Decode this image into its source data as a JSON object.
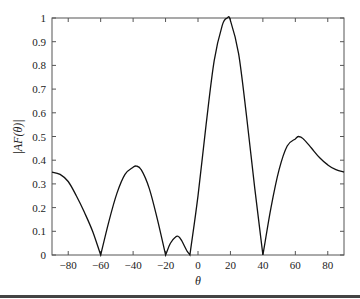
{
  "chart_data": {
    "type": "line",
    "title": "",
    "xlabel": "θ",
    "ylabel": "|AF(θ)|",
    "xlim": [
      -90,
      90
    ],
    "ylim": [
      0,
      1
    ],
    "grid": false,
    "legend": null,
    "xticks": [
      -80,
      -60,
      -40,
      -20,
      0,
      20,
      40,
      60,
      80
    ],
    "xtick_labels": [
      "−80",
      "−60",
      "−40",
      "−20",
      "0",
      "20",
      "40",
      "60",
      "80"
    ],
    "yticks": [
      0,
      0.1,
      0.2,
      0.3,
      0.4,
      0.5,
      0.6,
      0.7,
      0.8,
      0.9,
      1
    ],
    "ytick_labels": [
      "0",
      "0.1",
      "0.2",
      "0.3",
      "0.4",
      "0.5",
      "0.6",
      "0.7",
      "0.8",
      "0.9",
      "1"
    ],
    "series": [
      {
        "name": "|AF(θ)|",
        "color": "#111111",
        "x": [
          -90,
          -85,
          -80,
          -75,
          -70,
          -65,
          -60,
          -55,
          -50,
          -45,
          -40,
          -38,
          -35,
          -30,
          -25,
          -20,
          -17,
          -14,
          -12,
          -10,
          -7,
          -5,
          0,
          5,
          10,
          15,
          18,
          20,
          25,
          30,
          35,
          40,
          45,
          50,
          55,
          60,
          62,
          65,
          70,
          75,
          80,
          85,
          90
        ],
        "values": [
          0.35,
          0.34,
          0.31,
          0.25,
          0.18,
          0.1,
          0.0,
          0.14,
          0.26,
          0.34,
          0.37,
          0.375,
          0.36,
          0.28,
          0.15,
          0.0,
          0.05,
          0.075,
          0.078,
          0.06,
          0.02,
          0.0,
          0.25,
          0.55,
          0.82,
          0.97,
          1.0,
          0.99,
          0.85,
          0.58,
          0.28,
          0.0,
          0.2,
          0.36,
          0.46,
          0.49,
          0.5,
          0.49,
          0.45,
          0.41,
          0.38,
          0.36,
          0.35
        ]
      }
    ]
  }
}
